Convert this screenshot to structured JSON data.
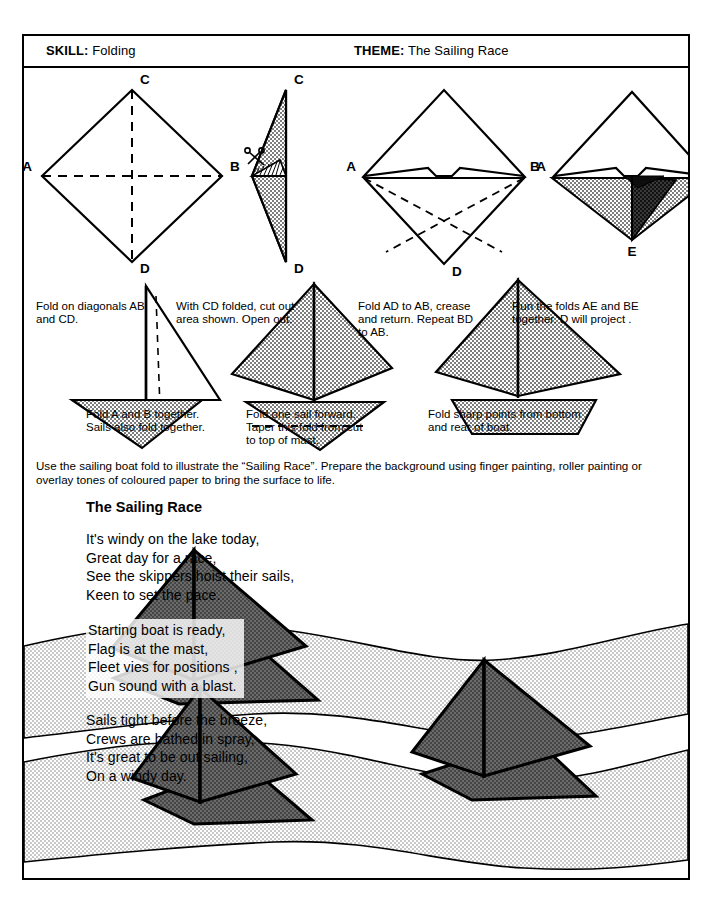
{
  "header": {
    "skill_label": "SKILL:",
    "skill_value": "Folding",
    "theme_label": "THEME:",
    "theme_value": "The Sailing Race"
  },
  "steps": [
    {
      "id": "step-1",
      "caption": "Fold on diagonals AB\nand CD.",
      "labels": [
        "A",
        "B",
        "C",
        "D"
      ]
    },
    {
      "id": "step-2",
      "caption": "With CD folded, cut out\narea shown. Open out.",
      "labels": [
        "C",
        "D"
      ]
    },
    {
      "id": "step-3",
      "caption": "Fold AD to AB, crease\nand return. Repeat BD\nto AB.",
      "labels": [
        "A",
        "B",
        "D"
      ]
    },
    {
      "id": "step-4",
      "caption": "Run the folds AE and BE\ntogether. D will project .",
      "labels": [
        "A",
        "B",
        "E"
      ]
    },
    {
      "id": "step-5",
      "caption": "Fold A and B together.\nSails also fold together.",
      "labels": []
    },
    {
      "id": "step-6",
      "caption": "Fold one sail forward.\nTaper this fold from cut\nto top of mast.",
      "labels": []
    },
    {
      "id": "step-7",
      "caption": "Fold sharp points from bottom\nand rear of boat.",
      "labels": []
    }
  ],
  "instruction": "Use the sailing boat fold to illustrate the “Sailing Race”. Prepare the background using finger painting, roller painting or overlay tones of coloured paper to bring the surface to life.",
  "poem": {
    "title": "The Sailing Race",
    "verses": [
      "It's windy on the lake today,\nGreat day for a race,\nSee the skippers hoist their sails,\nKeen to set the pace.",
      "Starting boat is ready,\nFlag is at the mast,\nFleet vies for positions ,\nGun sound with a blast.",
      "Sails tight before the breeze,\nCrews are bathed in spray,\nIt's great to be out sailing,\nOn a windy day."
    ]
  },
  "colors": {
    "ink": "#000000",
    "paper": "#ffffff",
    "diagram_shade": "#9a9a9a",
    "diagram_shade_dark": "#4a4a4a",
    "sail_fill": "#5f5f5f",
    "water_fill": "#e2e2e2"
  }
}
